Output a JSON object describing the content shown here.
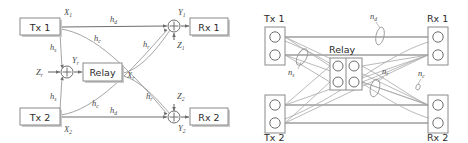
{
  "figure": {
    "panels": [
      "gaussian-model",
      "deterministic-model"
    ]
  },
  "colors": {
    "background": "#ffffff",
    "box_stroke": "#8a8a8a",
    "link_stroke": "#9a9a9a",
    "link_dark": "#6e6e6e",
    "text": "#2b2b2b",
    "symbol_text": "#4a4a4a",
    "shadow": "#c9c9c9"
  },
  "left_panel": {
    "name": "gaussian-model",
    "boxes": [
      {
        "id": "tx1",
        "label": "Tx 1",
        "x": 20,
        "y": 18,
        "w": 40,
        "h": 17
      },
      {
        "id": "tx2",
        "label": "Tx 2",
        "x": 20,
        "y": 108,
        "w": 40,
        "h": 17
      },
      {
        "id": "relay",
        "label": "Relay",
        "x": 83,
        "y": 63,
        "w": 39,
        "h": 18
      },
      {
        "id": "rx1",
        "label": "Rx 1",
        "x": 190,
        "y": 18,
        "w": 38,
        "h": 17
      },
      {
        "id": "rx2",
        "label": "Rx 2",
        "x": 190,
        "y": 108,
        "w": 38,
        "h": 17
      }
    ],
    "adders": [
      {
        "id": "adder-relay",
        "cx": 67,
        "cy": 72,
        "r": 6
      },
      {
        "id": "adder-rx1",
        "cx": 174,
        "cy": 26,
        "r": 6
      },
      {
        "id": "adder-rx2",
        "cx": 174,
        "cy": 117,
        "r": 6
      }
    ],
    "signal_labels": [
      {
        "id": "x1",
        "base": "X",
        "sub": "1",
        "x": 64,
        "y": 15
      },
      {
        "id": "x2",
        "base": "X",
        "sub": "2",
        "x": 64,
        "y": 132
      },
      {
        "id": "zr",
        "base": "Z",
        "sub": "r",
        "x": 40,
        "y": 74
      },
      {
        "id": "yr",
        "base": "Y",
        "sub": "r",
        "x": 72,
        "y": 63
      },
      {
        "id": "xr",
        "base": "X",
        "sub": "r",
        "x": 127,
        "y": 77
      },
      {
        "id": "y1",
        "base": "Y",
        "sub": "1",
        "x": 178,
        "y": 15
      },
      {
        "id": "z1",
        "base": "Z",
        "sub": "1",
        "x": 177,
        "y": 43
      },
      {
        "id": "z2",
        "base": "Z",
        "sub": "2",
        "x": 177,
        "y": 98
      },
      {
        "id": "y2",
        "base": "Y",
        "sub": "2",
        "x": 178,
        "y": 131
      }
    ],
    "channel_labels": [
      {
        "id": "hd-top",
        "base": "h",
        "sub": "d",
        "x": 113,
        "y": 22
      },
      {
        "id": "hd-bottom",
        "base": "h",
        "sub": "d",
        "x": 113,
        "y": 121
      },
      {
        "id": "hs-top",
        "base": "h",
        "sub": "s",
        "x": 51,
        "y": 50
      },
      {
        "id": "hs-bottom",
        "base": "h",
        "sub": "s",
        "x": 51,
        "y": 97
      },
      {
        "id": "hc-top",
        "base": "h",
        "sub": "c",
        "x": 96,
        "y": 40
      },
      {
        "id": "hc-bottom",
        "base": "h",
        "sub": "c",
        "x": 96,
        "y": 105
      },
      {
        "id": "hr-top",
        "base": "h",
        "sub": "r",
        "x": 145,
        "y": 46
      },
      {
        "id": "hr-bottom",
        "base": "h",
        "sub": "r",
        "x": 148,
        "y": 98
      }
    ]
  },
  "right_panel": {
    "name": "deterministic-model",
    "boxes": [
      {
        "id": "tx1",
        "label": "Tx 1",
        "label_pos": "above",
        "x": 31,
        "y": 27,
        "w": 20,
        "h": 38,
        "circles": 2,
        "cols": 1
      },
      {
        "id": "tx2",
        "label": "Tx 2",
        "label_pos": "below",
        "x": 31,
        "y": 95,
        "w": 20,
        "h": 38,
        "circles": 2,
        "cols": 1
      },
      {
        "id": "relay",
        "label": "Relay",
        "label_pos": "above",
        "x": 96,
        "y": 58,
        "w": 32,
        "h": 32,
        "circles": 4,
        "cols": 2
      },
      {
        "id": "rx1",
        "label": "Rx 1",
        "label_pos": "above",
        "x": 194,
        "y": 27,
        "w": 20,
        "h": 38,
        "circles": 2,
        "cols": 1
      },
      {
        "id": "rx2",
        "label": "Rx 2",
        "label_pos": "below",
        "x": 194,
        "y": 95,
        "w": 20,
        "h": 38,
        "circles": 2,
        "cols": 1
      }
    ],
    "level_labels": [
      {
        "id": "ns",
        "base": "n",
        "sub": "s",
        "x": 58,
        "y": 73
      },
      {
        "id": "nd",
        "base": "n",
        "sub": "d",
        "x": 140,
        "y": 17
      },
      {
        "id": "nr",
        "base": "n",
        "sub": "r",
        "x": 152,
        "y": 72
      },
      {
        "id": "nc",
        "base": "n",
        "sub": "c",
        "x": 188,
        "y": 74
      }
    ],
    "ellipse_marks": [
      {
        "id": "ns-mark",
        "cx": 68,
        "cy": 57,
        "rx": 4.5,
        "ry": 9,
        "rot": 28
      },
      {
        "id": "nd-mark",
        "cx": 146,
        "cy": 36,
        "rx": 4,
        "ry": 9,
        "rot": 12
      },
      {
        "id": "nr-mark",
        "cx": 141,
        "cy": 88,
        "rx": 4.5,
        "ry": 9,
        "rot": 14
      },
      {
        "id": "nc-mark",
        "cx": 184,
        "cy": 86,
        "rx": 2,
        "ry": 3,
        "rot": 20
      }
    ]
  }
}
